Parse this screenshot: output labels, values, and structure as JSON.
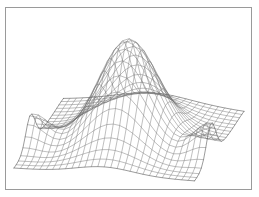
{
  "figure": {
    "kind": "3d-wireframe-surface",
    "title": "",
    "background_color": "#ffffff",
    "frame": {
      "border_color": "#9a9a9a",
      "border_width": 1,
      "x": 5,
      "y": 7,
      "width": 247,
      "height": 183
    },
    "mesh": {
      "line_color": "#6f6f6f",
      "edge_color": "#4a4a4a",
      "line_width": 0.45,
      "visible_faces": false,
      "style": "wireframe"
    }
  },
  "chart_data": {
    "type": "surface",
    "title": "",
    "subtitle": "",
    "xlabel": "",
    "ylabel": "",
    "zlabel": "",
    "axes_visible": false,
    "tick_labels": [],
    "legend": null,
    "grid": true,
    "description": "Perspective wireframe mesh of a smooth bivariate density surface: a single tall central peak with gently falling skirts and small upward flares at the left and right lateral corners.",
    "surface": {
      "function": "gaussian-mixture",
      "x_range": [
        -3,
        3
      ],
      "y_range": [
        -3,
        3
      ],
      "z_range": [
        0,
        1
      ],
      "nx": 29,
      "ny": 23,
      "components": [
        {
          "name": "main-peak",
          "amplitude": 1.0,
          "cx": 0.0,
          "cy": 0.15,
          "sx": 0.95,
          "sy": 1.25
        },
        {
          "name": "left-corner-rise",
          "amplitude": 0.3,
          "cx": -2.95,
          "cy": 1.0,
          "sx": 0.55,
          "sy": 0.55
        },
        {
          "name": "right-corner-rise",
          "amplitude": 0.34,
          "cx": 2.95,
          "cy": 1.0,
          "sx": 0.55,
          "sy": 0.55
        },
        {
          "name": "front-bow",
          "amplitude": 0.1,
          "cx": 0.0,
          "cy": -3.0,
          "sx": 1.8,
          "sy": 0.9
        }
      ]
    },
    "projection": {
      "type": "oblique-perspective",
      "azimuth_deg": -37.5,
      "elevation_deg": 22,
      "origin_x": 129,
      "origin_y": 141,
      "x_axis_screen": [
        6.45,
        0.46
      ],
      "y_axis_screen": [
        -2.25,
        3.05
      ],
      "z_scale": 103
    }
  },
  "annotations": {
    "peak_apex_screen": {
      "x": 128,
      "y": 22
    },
    "front_edge_label": "",
    "notes": ""
  }
}
